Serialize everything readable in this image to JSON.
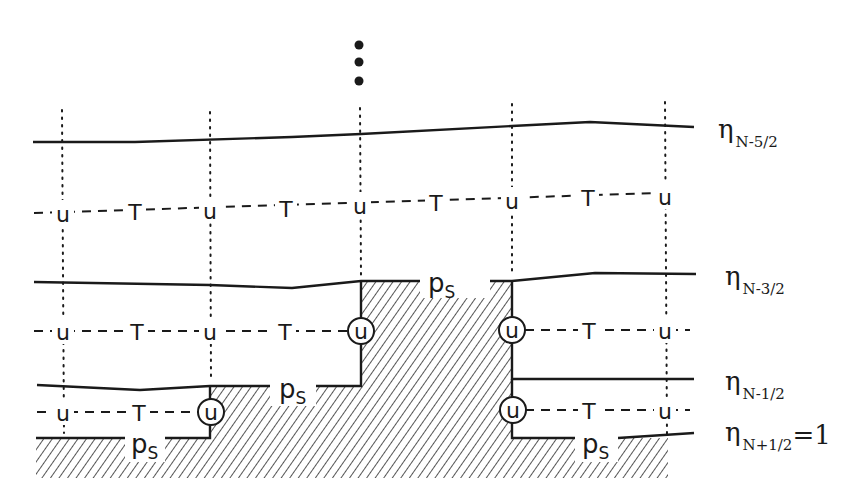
{
  "diagram": {
    "type": "vertical-grid-step-topography",
    "continuation_marker": "⋮",
    "colors": {
      "ink": "#1a1a1a",
      "background": "#ffffff",
      "hatch": "#2a2a2a"
    },
    "levels": [
      {
        "symbol": "η",
        "subscript": "N-5/2",
        "suffix": ""
      },
      {
        "symbol": "η",
        "subscript": "N-3/2",
        "suffix": ""
      },
      {
        "symbol": "η",
        "subscript": "N-1/2",
        "suffix": ""
      },
      {
        "symbol": "η",
        "subscript": "N+1/2",
        "suffix": "=1"
      }
    ],
    "layers": [
      {
        "nodes": [
          "u",
          "T",
          "u",
          "T",
          "u",
          "T",
          "u",
          "T",
          "u"
        ]
      },
      {
        "nodes": [
          "u",
          "T",
          "u",
          "T",
          "u",
          "u",
          "T",
          "u"
        ],
        "boundary_nodes": [
          "u",
          "u"
        ]
      },
      {
        "nodes": [
          "u",
          "T",
          "u",
          "u",
          "T",
          "u"
        ],
        "boundary_nodes": [
          "u",
          "u"
        ]
      }
    ],
    "surface_pressure_label": "p",
    "surface_pressure_sub": "S",
    "node_u": "u",
    "node_T": "T"
  }
}
